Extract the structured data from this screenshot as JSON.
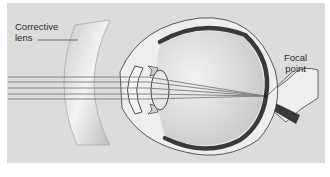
{
  "figure": {
    "labels": {
      "corrective_lens": [
        "Corrective",
        "lens"
      ],
      "focal_point": [
        "Focal",
        "point"
      ]
    },
    "rays": {
      "count": 5,
      "y_positions": [
        77,
        82,
        88,
        94,
        99
      ],
      "focal_point": [
        265,
        96
      ]
    },
    "colors": {
      "panel_background": "#dcdcdc",
      "retina_choroid": "#3a3a3a",
      "sclera_fill": "#eeeeee",
      "vitreous_fill": "#d8d8d8",
      "ray_color": "#7a7a7a",
      "lens_fill": "#cfcfcf"
    }
  }
}
